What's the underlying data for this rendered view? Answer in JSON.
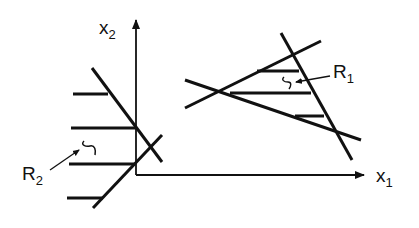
{
  "diagram": {
    "title": "",
    "colors": {
      "stroke": "#111111",
      "background": "#ffffff"
    },
    "axes": {
      "x": {
        "label": "x",
        "subscript": "1"
      },
      "y": {
        "label": "x",
        "subscript": "2"
      }
    },
    "regions": [
      {
        "id": "R1",
        "label": "R",
        "subscript": "1",
        "description": "Triangular region bounded by three lines, hatched"
      },
      {
        "id": "R2",
        "label": "R",
        "subscript": "2",
        "description": "Region to the left of two crossing lines, hatched"
      }
    ]
  }
}
